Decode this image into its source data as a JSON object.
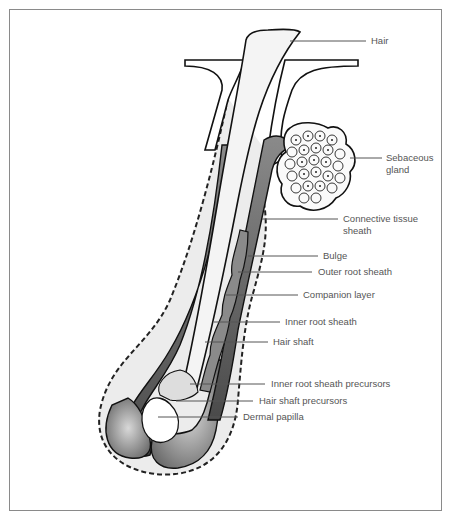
{
  "diagram": {
    "colors": {
      "frame": "#8a8a8a",
      "outline": "#1a1a1a",
      "dark_layer": "#5a5a5a",
      "mid_layer": "#9a9a9a",
      "light_fill": "#e6e6e6",
      "label_text": "#555555",
      "leader_line": "#555555"
    },
    "labels": [
      {
        "id": "hair",
        "text": "Hair"
      },
      {
        "id": "sebaceous",
        "text": "Sebaceous gland"
      },
      {
        "id": "connective",
        "text": "Connective tissue sheath"
      },
      {
        "id": "bulge",
        "text": "Bulge"
      },
      {
        "id": "ors",
        "text": "Outer root sheath"
      },
      {
        "id": "companion",
        "text": "Companion layer"
      },
      {
        "id": "irs",
        "text": "Inner root sheath"
      },
      {
        "id": "shaft",
        "text": "Hair shaft"
      },
      {
        "id": "irs_prec",
        "text": "Inner root sheath precursors"
      },
      {
        "id": "shaft_prec",
        "text": "Hair shaft precursors"
      },
      {
        "id": "papilla",
        "text": "Dermal papilla"
      }
    ]
  }
}
